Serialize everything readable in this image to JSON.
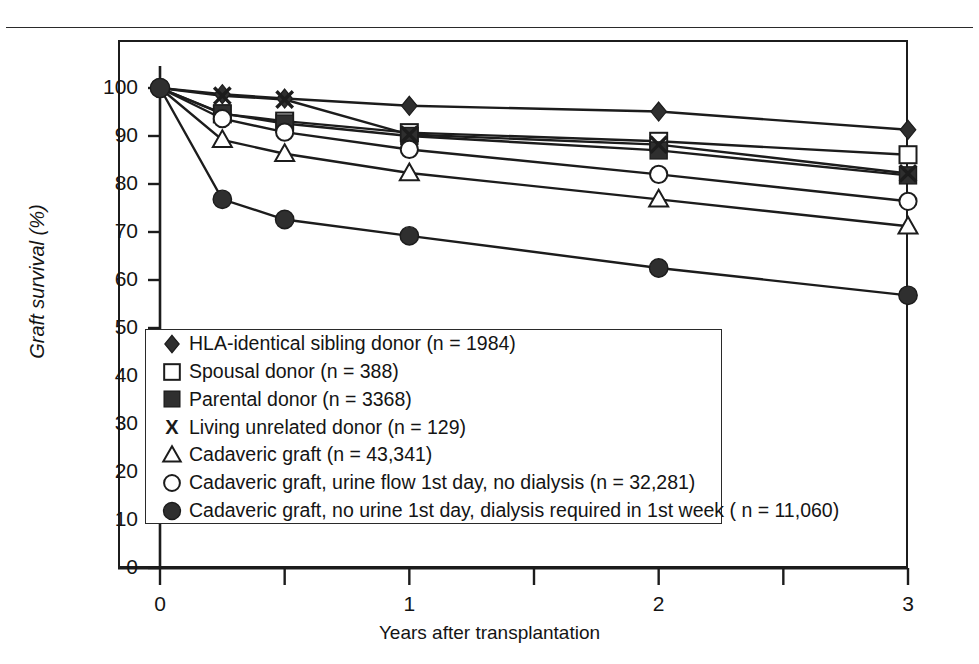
{
  "figure": {
    "title": "",
    "x_axis_label": "Years after transplantation",
    "y_axis_label": "Graft survival (%)"
  },
  "axes": {
    "y_ticks": [
      "0",
      "10",
      "20",
      "30",
      "40",
      "50",
      "60",
      "70",
      "80",
      "90",
      "100"
    ],
    "x_ticks": [
      "0",
      "1",
      "2",
      "3"
    ],
    "x_minor_ticks": [
      "0.5",
      "1.5",
      "2.5"
    ]
  },
  "legend": {
    "entries": [
      {
        "marker": "filled-diamond-icon",
        "label": "HLA-identical sibling donor (n = 1984)"
      },
      {
        "marker": "open-square-icon",
        "label": "Spousal donor (n = 388)"
      },
      {
        "marker": "filled-square-icon",
        "label": "Parental donor (n = 3368)"
      },
      {
        "marker": "x-marker-icon",
        "label": "Living unrelated donor (n = 129)"
      },
      {
        "marker": "open-triangle-icon",
        "label": "Cadaveric graft (n = 43,341)"
      },
      {
        "marker": "open-circle-icon",
        "label": "Cadaveric graft, urine flow 1st day, no dialysis (n = 32,281)"
      },
      {
        "marker": "filled-circle-icon",
        "label": "Cadaveric graft, no urine 1st day, dialysis required in 1st week ( n = 11,060)"
      }
    ]
  },
  "chart_data": {
    "type": "line",
    "title": "",
    "xlabel": "Years after transplantation",
    "ylabel": "Graft survival (%)",
    "xlim": [
      0,
      3
    ],
    "ylim": [
      0,
      100
    ],
    "grid": false,
    "legend_position": "inside-lower-left",
    "x": [
      0,
      0.25,
      0.5,
      1,
      2,
      3
    ],
    "series": [
      {
        "name": "HLA-identical sibling donor (n = 1984)",
        "marker": "filled-diamond",
        "color": "#2b2b2b",
        "values": [
          100,
          98.7,
          97.8,
          96.3,
          95.1,
          91.3
        ]
      },
      {
        "name": "Spousal donor (n = 388)",
        "marker": "open-square",
        "color": "#2b2b2b",
        "values": [
          100,
          94.6,
          93.1,
          90.7,
          88.9,
          86.1
        ]
      },
      {
        "name": "Parental donor (n = 3368)",
        "marker": "filled-square",
        "color": "#2b2b2b",
        "values": [
          100,
          94.7,
          92.6,
          90.0,
          87.0,
          81.8
        ]
      },
      {
        "name": "Living unrelated donor (n = 129)",
        "marker": "x-marker",
        "color": "#2b2b2b",
        "values": [
          100,
          98.4,
          97.6,
          90.3,
          88.2,
          82.2
        ]
      },
      {
        "name": "Cadaveric graft (n = 43,341)",
        "marker": "open-triangle",
        "color": "#2b2b2b",
        "values": [
          100,
          89.2,
          86.3,
          82.3,
          76.8,
          71.2
        ]
      },
      {
        "name": "Cadaveric graft, urine flow 1st day, no dialysis (n = 32,281)",
        "marker": "open-circle",
        "color": "#2b2b2b",
        "values": [
          100,
          93.6,
          90.8,
          87.2,
          82.0,
          76.4
        ]
      },
      {
        "name": "Cadaveric graft, no urine 1st day, dialysis required in 1st week ( n = 11,060)",
        "marker": "filled-circle",
        "color": "#2b2b2b",
        "values": [
          100,
          76.8,
          72.6,
          69.2,
          62.5,
          56.8
        ]
      }
    ]
  }
}
